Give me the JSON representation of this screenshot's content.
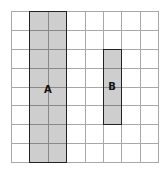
{
  "grid": {
    "columns": 8,
    "rows": 8,
    "line_color": "#a8a8a8"
  },
  "shapes": [
    {
      "label": "A",
      "col_start": 1,
      "col_span": 2,
      "row_start": 0,
      "row_span": 8,
      "fill": "#c8c8c8",
      "border": "#222222"
    },
    {
      "label": "B",
      "col_start": 5,
      "col_span": 1,
      "row_start": 2,
      "row_span": 4,
      "fill": "#c8c8c8",
      "border": "#222222"
    }
  ]
}
